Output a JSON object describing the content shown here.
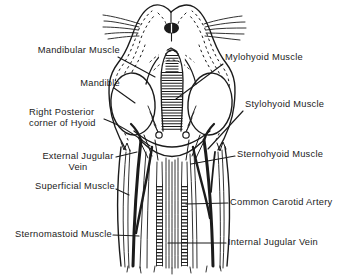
{
  "figure": {
    "colors": {
      "ink": "#1b1b1b",
      "background": "#ffffff"
    }
  },
  "labels": {
    "mandibular_muscle": "Mandibular Muscle",
    "mylohyoid_muscle": "Mylohyoid Muscle",
    "mandible": "Mandible",
    "stylohyoid_muscle": "Stylohyoid Muscle",
    "right_posterior_corner_of_hyoid": "Right Posterior\ncorner of Hyoid",
    "external_jugular_vein": "External Jugular\nVein",
    "sternohyoid_muscle": "Sternohyoid Muscle",
    "superficial_muscle": "Superficial Muscle",
    "common_carotid_artery": "Common Carotid Artery",
    "sternomastoid_muscle": "Sternomastoid Muscle",
    "internal_jugular_vein": "Internal Jugular Vein"
  }
}
